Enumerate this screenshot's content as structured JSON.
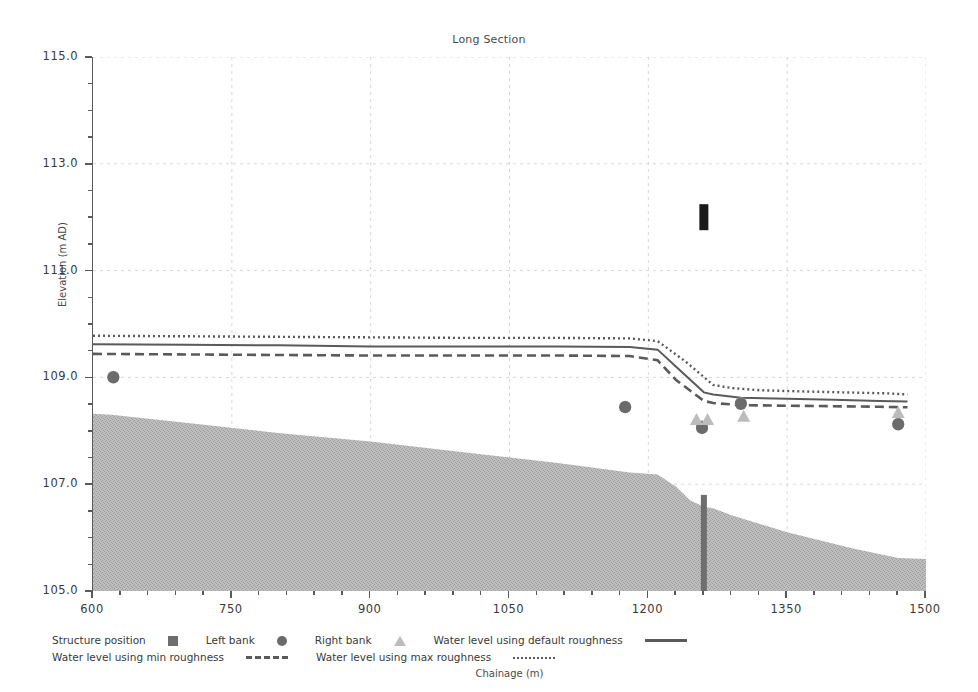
{
  "chart_data": {
    "type": "line",
    "title": "Long Section",
    "xlabel": "Chainage (m)",
    "ylabel": "Elevation (m AD)",
    "xlim": [
      600,
      1500
    ],
    "ylim": [
      105.0,
      115.0
    ],
    "x_ticks": [
      600,
      750,
      900,
      1050,
      1200,
      1350,
      1500
    ],
    "x_tick_labels": [
      "600",
      "750",
      "900",
      "1050",
      "1200",
      "1350",
      "1500"
    ],
    "x_minor_step": 30,
    "y_ticks": [
      105.0,
      107.0,
      109.0,
      111.0,
      113.0,
      115.0
    ],
    "y_tick_labels": [
      "105.0",
      "107.0",
      "109.0",
      "111.0",
      "113.0",
      "115.0"
    ],
    "y_minor_step": 0.5,
    "grid": true,
    "legend_position": "below",
    "series": [
      {
        "name": "Bed level",
        "style": "filled-area",
        "color": "#b5b5b5",
        "x": [
          600,
          620,
          700,
          800,
          900,
          1000,
          1100,
          1180,
          1210,
          1230,
          1245,
          1260,
          1270,
          1290,
          1350,
          1420,
          1470,
          1500
        ],
        "values": [
          108.32,
          108.3,
          108.15,
          107.96,
          107.8,
          107.6,
          107.4,
          107.22,
          107.18,
          106.95,
          106.7,
          106.58,
          106.55,
          106.42,
          106.1,
          105.8,
          105.62,
          105.6
        ]
      },
      {
        "name": "Water level using default roughness",
        "style": "solid",
        "color": "#5a5a5a",
        "x": [
          600,
          700,
          800,
          900,
          1000,
          1100,
          1180,
          1210,
          1230,
          1260,
          1270,
          1300,
          1350,
          1400,
          1450,
          1480
        ],
        "values": [
          109.62,
          109.61,
          109.6,
          109.58,
          109.58,
          109.58,
          109.57,
          109.52,
          109.2,
          108.72,
          108.68,
          108.62,
          108.6,
          108.58,
          108.56,
          108.55
        ]
      },
      {
        "name": "Water level using min roughness",
        "style": "dashed",
        "color": "#5a5a5a",
        "x": [
          600,
          700,
          800,
          900,
          1000,
          1100,
          1180,
          1210,
          1230,
          1260,
          1270,
          1300,
          1350,
          1400,
          1450,
          1480
        ],
        "values": [
          109.44,
          109.43,
          109.42,
          109.41,
          109.41,
          109.41,
          109.4,
          109.32,
          108.95,
          108.56,
          108.52,
          108.48,
          108.47,
          108.46,
          108.45,
          108.44
        ]
      },
      {
        "name": "Water level using max roughness",
        "style": "dotted",
        "color": "#5a5a5a",
        "x": [
          600,
          700,
          800,
          900,
          1000,
          1100,
          1180,
          1210,
          1240,
          1270,
          1290,
          1320,
          1360,
          1410,
          1460,
          1480
        ],
        "values": [
          109.78,
          109.77,
          109.76,
          109.75,
          109.74,
          109.74,
          109.73,
          109.68,
          109.3,
          108.86,
          108.8,
          108.76,
          108.74,
          108.72,
          108.7,
          108.68
        ]
      }
    ],
    "markers": [
      {
        "name": "Left bank",
        "shape": "circle",
        "color": "#8a8a8a",
        "points": [
          [
            622,
            109.01
          ],
          [
            1175,
            108.45
          ],
          [
            1258,
            108.08
          ],
          [
            1300,
            108.52
          ],
          [
            1470,
            108.13
          ]
        ]
      },
      {
        "name": "Right bank",
        "shape": "circle",
        "color": "#6b6b6b",
        "points": [
          [
            622,
            109.0
          ],
          [
            1175,
            108.44
          ],
          [
            1258,
            108.05
          ],
          [
            1300,
            108.5
          ],
          [
            1470,
            108.12
          ]
        ]
      },
      {
        "name": "Water level using default roughness",
        "shape": "triangle",
        "color": "#bcbcbc",
        "points": [
          [
            1252,
            108.22
          ],
          [
            1264,
            108.22
          ],
          [
            1303,
            108.28
          ],
          [
            1470,
            108.35
          ]
        ]
      },
      {
        "name": "Structure position",
        "shape": "bar",
        "color": "#1a1a1a",
        "points": [
          [
            1260,
            112.0
          ]
        ]
      },
      {
        "name": "Structure position",
        "shape": "bed-bar",
        "color": "#6e6e6e",
        "points": [
          [
            1260,
            106.4
          ]
        ]
      }
    ]
  },
  "legend": {
    "rows": [
      [
        {
          "label": "Structure position",
          "swatch": "square"
        },
        {
          "label": "Left bank",
          "swatch": "circle"
        },
        {
          "label": "Right bank",
          "swatch": "triangle"
        },
        {
          "label": "Water level using default roughness",
          "swatch": "solid-line"
        }
      ],
      [
        {
          "label": "Water level using min roughness",
          "swatch": "dashed-line"
        },
        {
          "label": "Water level using max roughness",
          "swatch": "dotted-line"
        }
      ]
    ],
    "items": {
      "structure_position": "Structure position",
      "left_bank": "Left bank",
      "right_bank": "Right bank",
      "default_roughness": "Water level using default roughness",
      "min_roughness": "Water level using min roughness",
      "max_roughness": "Water level using max roughness"
    }
  },
  "colors": {
    "bed_fill": "#b5b5b5",
    "line": "#5a5a5a",
    "axis": "#5a5a5a",
    "grid": "#d8d8d8",
    "marker_dark": "#6b6b6b",
    "marker_light": "#bcbcbc",
    "structure": "#1a1a1a"
  }
}
